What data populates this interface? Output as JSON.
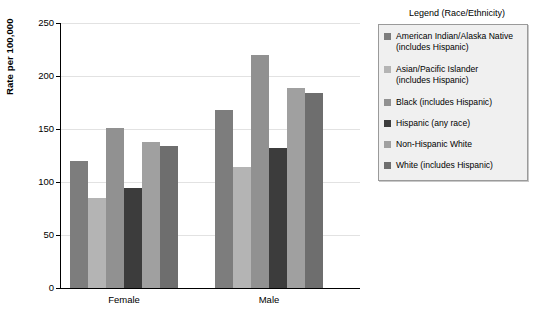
{
  "chart_data": {
    "type": "bar",
    "title": "",
    "xlabel": "",
    "ylabel": "Rate per 100,000",
    "ylim": [
      0,
      250
    ],
    "yticks": [
      0,
      50,
      100,
      150,
      200,
      250
    ],
    "ytick_labels": [
      "0",
      "50",
      "100",
      "150",
      "200",
      "250"
    ],
    "grid": true,
    "legend_position": "right",
    "legend_title": "Legend (Race/Ethnicity)",
    "categories": [
      "Female",
      "Male"
    ],
    "series": [
      {
        "name": "American Indian/Alaska Native (includes Hispanic)",
        "label_line1": "American Indian/Alaska Native",
        "label_line2": "(includes Hispanic)",
        "color": "#7d7d7d",
        "values": [
          120,
          168
        ]
      },
      {
        "name": "Asian/Pacific Islander (includes Hispanic)",
        "label_line1": "Asian/Pacific Islander",
        "label_line2": "(includes Hispanic)",
        "color": "#b4b4b4",
        "values": [
          85,
          114
        ]
      },
      {
        "name": "Black (includes Hispanic)",
        "label_line1": "Black (includes Hispanic)",
        "label_line2": "",
        "color": "#919191",
        "values": [
          151,
          220
        ]
      },
      {
        "name": "Hispanic (any race)",
        "label_line1": "Hispanic (any race)",
        "label_line2": "",
        "color": "#3c3c3c",
        "values": [
          94,
          132
        ]
      },
      {
        "name": "Non-Hispanic White",
        "label_line1": "Non-Hispanic White",
        "label_line2": "",
        "color": "#a0a0a0",
        "values": [
          138,
          189
        ]
      },
      {
        "name": "White (includes Hispanic)",
        "label_line1": "White (includes Hispanic)",
        "label_line2": "",
        "color": "#6e6e6e",
        "values": [
          134,
          184
        ]
      }
    ]
  }
}
